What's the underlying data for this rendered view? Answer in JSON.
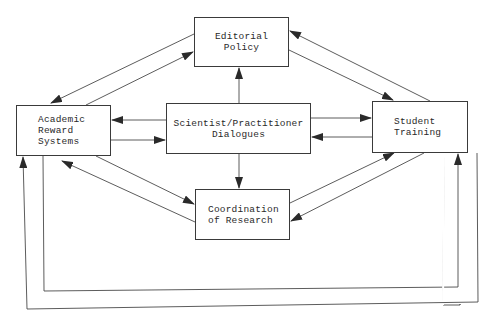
{
  "diagram": {
    "type": "flowchart",
    "line_color": "#3a3a3a",
    "background": "#ffffff",
    "nodes": [
      {
        "id": "editorial",
        "label": "Editorial\nPolicy"
      },
      {
        "id": "academic",
        "label": "Academic\nReward\nSystems"
      },
      {
        "id": "dialogues",
        "label": "Scientist/Practitioner\nDialogues"
      },
      {
        "id": "student",
        "label": "Student\nTraining"
      },
      {
        "id": "coord",
        "label": "Coordination\nof Research"
      }
    ],
    "edges": [
      {
        "from": "editorial",
        "to": "academic"
      },
      {
        "from": "academic",
        "to": "editorial"
      },
      {
        "from": "editorial",
        "to": "student"
      },
      {
        "from": "student",
        "to": "editorial"
      },
      {
        "from": "dialogues",
        "to": "editorial"
      },
      {
        "from": "dialogues",
        "to": "academic"
      },
      {
        "from": "academic",
        "to": "dialogues"
      },
      {
        "from": "dialogues",
        "to": "student"
      },
      {
        "from": "student",
        "to": "dialogues"
      },
      {
        "from": "dialogues",
        "to": "coord"
      },
      {
        "from": "academic",
        "to": "coord"
      },
      {
        "from": "coord",
        "to": "academic"
      },
      {
        "from": "coord",
        "to": "student"
      },
      {
        "from": "student",
        "to": "coord"
      },
      {
        "from": "academic",
        "to": "student",
        "route": "bottom-inner-loop"
      },
      {
        "from": "student",
        "to": "academic",
        "route": "bottom-outer-loop"
      }
    ]
  }
}
